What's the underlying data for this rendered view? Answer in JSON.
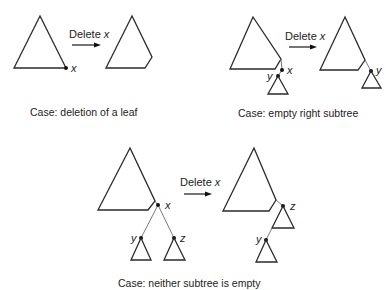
{
  "figure": {
    "panels": [
      {
        "id": "leaf",
        "operation_label": "Delete",
        "operation_var": "x",
        "caption": "Case: deletion of a leaf",
        "before_labels": {
          "x": "x"
        },
        "after_labels": {}
      },
      {
        "id": "empty-right",
        "operation_label": "Delete",
        "operation_var": "x",
        "caption": "Case: empty right subtree",
        "before_labels": {
          "x": "x",
          "y": "y"
        },
        "after_labels": {
          "y": "y"
        }
      },
      {
        "id": "neither-empty",
        "operation_label": "Delete",
        "operation_var": "x",
        "caption": "Case: neither subtree is empty",
        "before_labels": {
          "x": "x",
          "y": "y",
          "z": "z"
        },
        "after_labels": {
          "y": "y",
          "z": "z"
        }
      }
    ],
    "colors": {
      "stroke": "#2a2a2a",
      "node": "#111111",
      "text": "#222222",
      "background": "#ffffff"
    }
  }
}
